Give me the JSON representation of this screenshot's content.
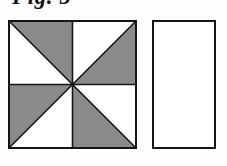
{
  "figure": {
    "caption": "Fig. 5",
    "background_color": "#fdfdfd",
    "shapes": [
      {
        "name": "pinwheel-square",
        "type": "square",
        "x": 8,
        "y": 20,
        "width": 129,
        "height": 129,
        "stroke_color": "#151515",
        "stroke_width": 2,
        "fill_gray": "#8a8a8a",
        "fill_white": "#ffffff",
        "subdivision": "four quadrants, each split by a diagonal into one gray and one white triangle, forming a pinwheel",
        "quadrants": [
          {
            "name": "top-left",
            "diagonal": "main",
            "gray_triangle": "upper-right",
            "white_triangle": "lower-left"
          },
          {
            "name": "top-right",
            "diagonal": "anti",
            "gray_triangle": "lower-right",
            "white_triangle": "upper-left"
          },
          {
            "name": "bottom-left",
            "diagonal": "anti",
            "gray_triangle": "upper-left",
            "white_triangle": "lower-right"
          },
          {
            "name": "bottom-right",
            "diagonal": "main",
            "gray_triangle": "lower-left",
            "white_triangle": "upper-right"
          }
        ],
        "gray_triangle_count": 4,
        "white_triangle_count": 4
      },
      {
        "name": "empty-rectangle",
        "type": "rectangle",
        "x": 152,
        "y": 20,
        "width": 64,
        "height": 129,
        "stroke_color": "#151515",
        "stroke_width": 2,
        "fill": "#ffffff",
        "subdivision": "none",
        "contents": "empty"
      }
    ]
  }
}
